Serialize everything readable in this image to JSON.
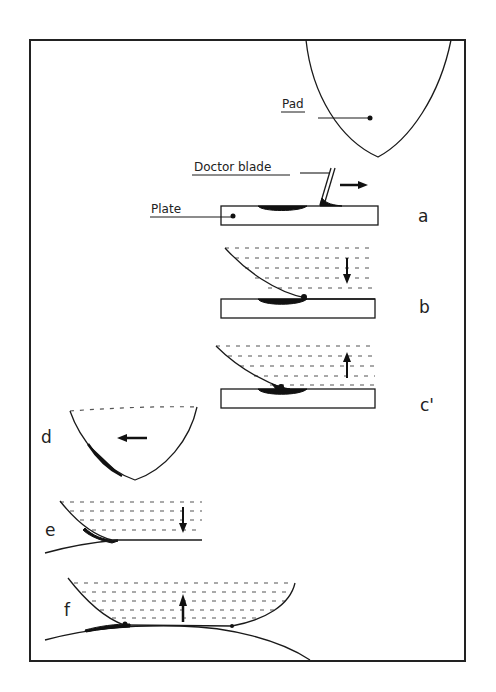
{
  "figure": {
    "labels": {
      "pad": "Pad",
      "doctor_blade": "Doctor blade",
      "plate": "Plate"
    },
    "panels": [
      {
        "id": "a",
        "label": "a",
        "caption": "Doctor blade wipes plate; ink remains in etched recess",
        "motion": "right"
      },
      {
        "id": "b",
        "label": "b",
        "caption": "Pad descends onto plate and picks up ink",
        "motion": "down"
      },
      {
        "id": "c",
        "label": "c'",
        "caption": "Pad lifts away carrying ink",
        "motion": "up"
      },
      {
        "id": "d",
        "label": "d",
        "caption": "Pad with ink moves to substrate",
        "motion": "left"
      },
      {
        "id": "e",
        "label": "e",
        "caption": "Pad descends onto curved substrate",
        "motion": "down"
      },
      {
        "id": "f",
        "label": "f",
        "caption": "Pad lifts, ink transferred onto substrate",
        "motion": "up"
      }
    ],
    "colors": {
      "line": "#1a1a1a",
      "ink": "#111111",
      "background": "#ffffff"
    }
  }
}
